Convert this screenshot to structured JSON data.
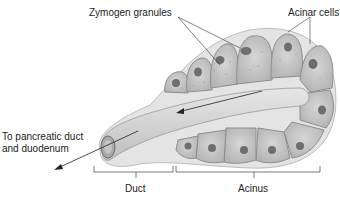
{
  "diagram": {
    "labels": {
      "zymogen": "Zymogen granules",
      "acinar": "Acinar cells",
      "outlet_line1": "To pancreatic duct",
      "outlet_line2": "and duodenum",
      "duct": "Duct",
      "acinus": "Acinus"
    },
    "colors": {
      "cell_fill": "#c9c9c9",
      "cell_outline": "#8e8e8e",
      "nucleus": "#6a6a6a",
      "lumen": "#dcdcdc",
      "background": "#ffffff",
      "text": "#222222"
    }
  }
}
